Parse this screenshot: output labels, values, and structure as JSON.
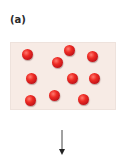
{
  "panel_label": "(a)",
  "container": {
    "fill_color": "#f7ebe5",
    "particle_color": "#e0201f",
    "particle_count": 10,
    "particles": [
      {
        "x": 27,
        "y": 54
      },
      {
        "x": 69,
        "y": 50
      },
      {
        "x": 92,
        "y": 56
      },
      {
        "x": 57,
        "y": 62
      },
      {
        "x": 31,
        "y": 78
      },
      {
        "x": 72,
        "y": 78
      },
      {
        "x": 94,
        "y": 78
      },
      {
        "x": 30,
        "y": 100
      },
      {
        "x": 54,
        "y": 95
      },
      {
        "x": 83,
        "y": 99
      }
    ]
  },
  "arrow": {
    "direction": "down",
    "color": "#333333"
  }
}
